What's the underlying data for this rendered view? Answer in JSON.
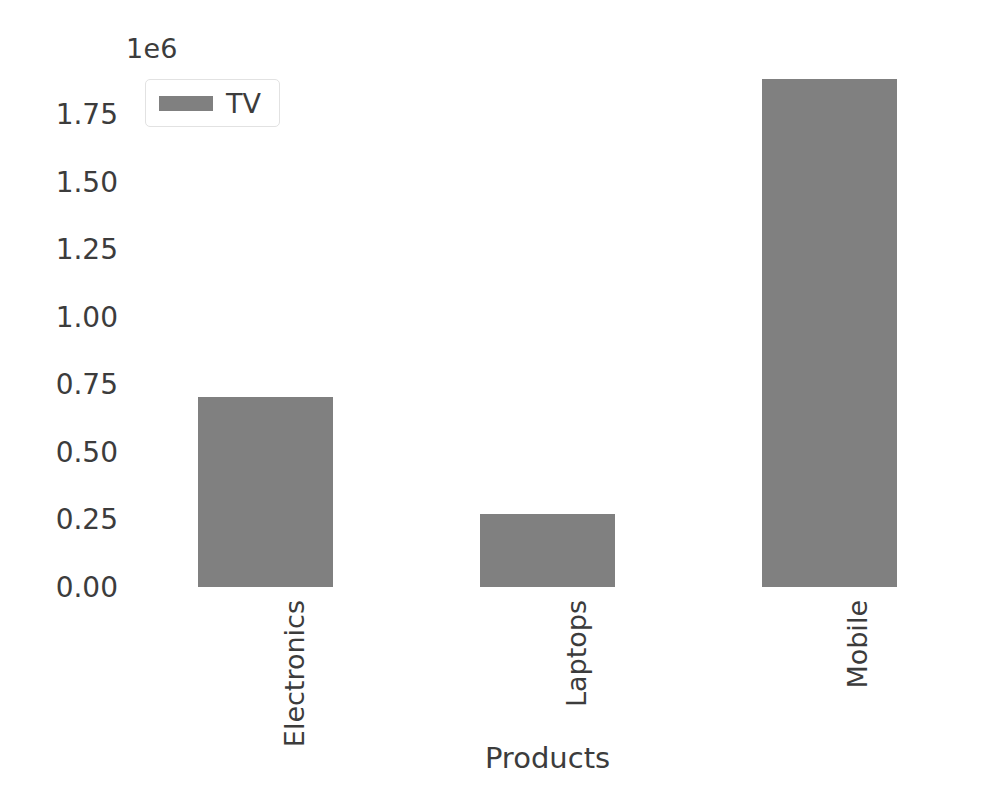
{
  "chart_data": {
    "type": "bar",
    "title": "",
    "subtitle": "",
    "categories": [
      "Electronics",
      "Laptops",
      "Mobile"
    ],
    "series": [
      {
        "name": "TV",
        "values": [
          704000,
          271000,
          1878000
        ],
        "color": "#808080"
      }
    ],
    "xlabel": "Products",
    "ylabel": "",
    "y_offset_label": "1e6",
    "y_offset_multiplier": 1000000,
    "ylim": [
      0,
      1950000
    ],
    "yticks": [
      0,
      250000,
      500000,
      750000,
      1000000,
      1250000,
      1500000,
      1750000
    ],
    "ytick_labels": [
      "0.00",
      "0.25",
      "0.50",
      "0.75",
      "1.00",
      "1.25",
      "1.50",
      "1.75"
    ],
    "grid": false,
    "legend": {
      "position": "upper left",
      "entries": [
        {
          "label": "TV",
          "color": "#808080"
        }
      ]
    },
    "xtick_rotation": 90,
    "background_color": "#ffffff",
    "text_color": "#3c3c3c"
  }
}
